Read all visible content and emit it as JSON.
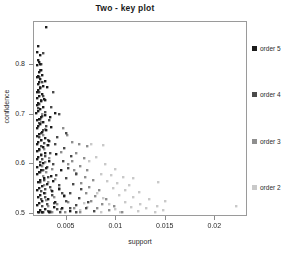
{
  "chart_data": {
    "type": "scatter",
    "title": "Two -  key plot",
    "xlabel": "support",
    "ylabel": "confidence",
    "xlim": [
      0.0018,
      0.0232
    ],
    "ylim": [
      0.495,
      0.885
    ],
    "grid": false,
    "legend_position": "right",
    "xticks": [
      0.005,
      0.01,
      0.015,
      0.02
    ],
    "xtick_labels": [
      "0.005",
      "0.01",
      "0.015",
      "0.02"
    ],
    "yticks": [
      0.5,
      0.6,
      0.7,
      0.8
    ],
    "ytick_labels": [
      "0.5",
      "0.6",
      "0.7",
      "0.8"
    ],
    "series": [
      {
        "name": "order 5",
        "color": "#1c1c1c",
        "points": [
          [
            0.00302,
            0.8755
          ],
          [
            0.00222,
            0.836
          ],
          [
            0.00212,
            0.824
          ],
          [
            0.00236,
            0.819
          ],
          [
            0.00218,
            0.8085
          ],
          [
            0.00226,
            0.805
          ],
          [
            0.0024,
            0.801
          ],
          [
            0.00214,
            0.7985
          ],
          [
            0.0025,
            0.789
          ],
          [
            0.00232,
            0.783
          ],
          [
            0.00262,
            0.7775
          ],
          [
            0.00222,
            0.776
          ],
          [
            0.0021,
            0.773
          ],
          [
            0.00244,
            0.769
          ],
          [
            0.0023,
            0.7645
          ],
          [
            0.00216,
            0.76
          ],
          [
            0.00268,
            0.7565
          ],
          [
            0.0024,
            0.752
          ],
          [
            0.0022,
            0.748
          ],
          [
            0.00208,
            0.744
          ],
          [
            0.00256,
            0.74
          ],
          [
            0.00232,
            0.736
          ],
          [
            0.00214,
            0.732
          ],
          [
            0.00278,
            0.729
          ],
          [
            0.00246,
            0.725
          ],
          [
            0.00222,
            0.721
          ],
          [
            0.00206,
            0.717
          ],
          [
            0.00268,
            0.713
          ],
          [
            0.00238,
            0.709
          ],
          [
            0.00218,
            0.705
          ],
          [
            0.00205,
            0.701
          ],
          [
            0.0029,
            0.698
          ],
          [
            0.00252,
            0.694
          ],
          [
            0.00228,
            0.69
          ],
          [
            0.0021,
            0.686
          ],
          [
            0.00272,
            0.682
          ],
          [
            0.0024,
            0.678
          ],
          [
            0.0022,
            0.674
          ],
          [
            0.00206,
            0.67
          ],
          [
            0.003,
            0.667
          ],
          [
            0.00258,
            0.663
          ],
          [
            0.0023,
            0.659
          ],
          [
            0.00212,
            0.655
          ],
          [
            0.00286,
            0.651
          ],
          [
            0.00246,
            0.647
          ],
          [
            0.00222,
            0.643
          ],
          [
            0.00207,
            0.639
          ],
          [
            0.00318,
            0.636
          ],
          [
            0.00266,
            0.632
          ],
          [
            0.00234,
            0.628
          ],
          [
            0.00214,
            0.624
          ],
          [
            0.00296,
            0.62
          ],
          [
            0.0025,
            0.616
          ],
          [
            0.00224,
            0.612
          ],
          [
            0.00208,
            0.608
          ],
          [
            0.00336,
            0.605
          ],
          [
            0.00272,
            0.601
          ],
          [
            0.00236,
            0.597
          ],
          [
            0.00215,
            0.593
          ],
          [
            0.00306,
            0.589
          ],
          [
            0.00254,
            0.585
          ],
          [
            0.00226,
            0.581
          ],
          [
            0.00209,
            0.577
          ],
          [
            0.0035,
            0.574
          ],
          [
            0.00278,
            0.57
          ],
          [
            0.00238,
            0.566
          ],
          [
            0.00216,
            0.562
          ],
          [
            0.00314,
            0.558
          ],
          [
            0.00256,
            0.554
          ],
          [
            0.00228,
            0.55
          ],
          [
            0.0021,
            0.546
          ],
          [
            0.00366,
            0.543
          ],
          [
            0.00284,
            0.539
          ],
          [
            0.0024,
            0.535
          ],
          [
            0.00217,
            0.531
          ],
          [
            0.00322,
            0.527
          ],
          [
            0.00258,
            0.523
          ],
          [
            0.00229,
            0.519
          ],
          [
            0.00211,
            0.515
          ],
          [
            0.0038,
            0.512
          ],
          [
            0.0029,
            0.508
          ],
          [
            0.00242,
            0.505
          ],
          [
            0.00218,
            0.502
          ],
          [
            0.0033,
            0.5005
          ],
          [
            0.00262,
            0.5002
          ],
          [
            0.00232,
            0.5001
          ],
          [
            0.0039,
            0.7005
          ],
          [
            0.00356,
            0.672
          ],
          [
            0.00336,
            0.6455
          ],
          [
            0.00404,
            0.6185
          ],
          [
            0.00448,
            0.586
          ],
          [
            0.00372,
            0.564
          ],
          [
            0.00428,
            0.5475
          ],
          [
            0.00486,
            0.533
          ],
          [
            0.00396,
            0.5205
          ],
          [
            0.0046,
            0.51
          ],
          [
            0.0054,
            0.5035
          ],
          [
            0.0031,
            0.753
          ],
          [
            0.00296,
            0.728
          ],
          [
            0.0034,
            0.6935
          ],
          [
            0.00288,
            0.766
          ]
        ]
      },
      {
        "name": "order 4",
        "color": "#4a4a4a",
        "points": [
          [
            0.00268,
            0.8215
          ],
          [
            0.00248,
            0.8005
          ],
          [
            0.00238,
            0.788
          ],
          [
            0.00228,
            0.773
          ],
          [
            0.00258,
            0.764
          ],
          [
            0.0024,
            0.753
          ],
          [
            0.00226,
            0.744
          ],
          [
            0.00274,
            0.7355
          ],
          [
            0.00252,
            0.727
          ],
          [
            0.00234,
            0.719
          ],
          [
            0.00222,
            0.711
          ],
          [
            0.00288,
            0.7035
          ],
          [
            0.0026,
            0.696
          ],
          [
            0.0024,
            0.6885
          ],
          [
            0.00226,
            0.681
          ],
          [
            0.00306,
            0.674
          ],
          [
            0.00272,
            0.667
          ],
          [
            0.00246,
            0.66
          ],
          [
            0.0023,
            0.653
          ],
          [
            0.00324,
            0.6465
          ],
          [
            0.00284,
            0.64
          ],
          [
            0.00252,
            0.6335
          ],
          [
            0.00232,
            0.627
          ],
          [
            0.00346,
            0.621
          ],
          [
            0.00296,
            0.615
          ],
          [
            0.0026,
            0.609
          ],
          [
            0.00236,
            0.603
          ],
          [
            0.0037,
            0.5975
          ],
          [
            0.0031,
            0.592
          ],
          [
            0.00268,
            0.5865
          ],
          [
            0.0024,
            0.581
          ],
          [
            0.00398,
            0.576
          ],
          [
            0.00326,
            0.571
          ],
          [
            0.00276,
            0.566
          ],
          [
            0.00244,
            0.561
          ],
          [
            0.00428,
            0.5565
          ],
          [
            0.00344,
            0.552
          ],
          [
            0.00286,
            0.5475
          ],
          [
            0.00248,
            0.543
          ],
          [
            0.00462,
            0.539
          ],
          [
            0.00364,
            0.535
          ],
          [
            0.00296,
            0.531
          ],
          [
            0.00252,
            0.527
          ],
          [
            0.005,
            0.5235
          ],
          [
            0.00386,
            0.52
          ],
          [
            0.00308,
            0.5165
          ],
          [
            0.00256,
            0.513
          ],
          [
            0.00544,
            0.51
          ],
          [
            0.00412,
            0.507
          ],
          [
            0.00322,
            0.504
          ],
          [
            0.00262,
            0.502
          ],
          [
            0.006,
            0.5008
          ],
          [
            0.00444,
            0.5005
          ],
          [
            0.0034,
            0.5003
          ],
          [
            0.0027,
            0.5001
          ],
          [
            0.00436,
            0.6985
          ],
          [
            0.00502,
            0.661
          ],
          [
            0.00412,
            0.6525
          ],
          [
            0.00478,
            0.631
          ],
          [
            0.00554,
            0.614
          ],
          [
            0.0047,
            0.604
          ],
          [
            0.0052,
            0.5895
          ],
          [
            0.00602,
            0.577
          ],
          [
            0.005,
            0.57
          ],
          [
            0.00572,
            0.558
          ],
          [
            0.00654,
            0.547
          ],
          [
            0.00548,
            0.54
          ],
          [
            0.00636,
            0.53
          ],
          [
            0.00722,
            0.5215
          ],
          [
            0.006,
            0.516
          ],
          [
            0.007,
            0.5085
          ],
          [
            0.0079,
            0.503
          ],
          [
            0.00376,
            0.744
          ],
          [
            0.0035,
            0.714
          ],
          [
            0.00332,
            0.687
          ],
          [
            0.0039,
            0.638
          ]
        ]
      },
      {
        "name": "order 3",
        "color": "#8e8e8e",
        "points": [
          [
            0.00262,
            0.7
          ],
          [
            0.00248,
            0.683
          ],
          [
            0.00288,
            0.669
          ],
          [
            0.00266,
            0.657
          ],
          [
            0.0025,
            0.646
          ],
          [
            0.00308,
            0.637
          ],
          [
            0.00276,
            0.628
          ],
          [
            0.00254,
            0.619
          ],
          [
            0.00334,
            0.611
          ],
          [
            0.0029,
            0.603
          ],
          [
            0.0026,
            0.595
          ],
          [
            0.00362,
            0.588
          ],
          [
            0.00306,
            0.581
          ],
          [
            0.00268,
            0.574
          ],
          [
            0.00396,
            0.568
          ],
          [
            0.00326,
            0.562
          ],
          [
            0.00278,
            0.556
          ],
          [
            0.00434,
            0.5505
          ],
          [
            0.0035,
            0.545
          ],
          [
            0.0029,
            0.54
          ],
          [
            0.00478,
            0.535
          ],
          [
            0.00378,
            0.5305
          ],
          [
            0.00304,
            0.526
          ],
          [
            0.00528,
            0.5215
          ],
          [
            0.0041,
            0.5175
          ],
          [
            0.0032,
            0.5135
          ],
          [
            0.00584,
            0.51
          ],
          [
            0.00448,
            0.507
          ],
          [
            0.0034,
            0.504
          ],
          [
            0.00648,
            0.5015
          ],
          [
            0.00492,
            0.5008
          ],
          [
            0.00366,
            0.5003
          ],
          [
            0.0056,
            0.642
          ],
          [
            0.00636,
            0.638
          ],
          [
            0.0072,
            0.634
          ],
          [
            0.006,
            0.62
          ],
          [
            0.0068,
            0.61
          ],
          [
            0.0056,
            0.604
          ],
          [
            0.0064,
            0.594
          ],
          [
            0.0072,
            0.586
          ],
          [
            0.006,
            0.58
          ],
          [
            0.0069,
            0.572
          ],
          [
            0.0078,
            0.565
          ],
          [
            0.0065,
            0.559
          ],
          [
            0.0074,
            0.551
          ],
          [
            0.0084,
            0.545
          ],
          [
            0.007,
            0.539
          ],
          [
            0.008,
            0.533
          ],
          [
            0.0091,
            0.528
          ],
          [
            0.0076,
            0.523
          ],
          [
            0.0087,
            0.518
          ],
          [
            0.0099,
            0.513
          ],
          [
            0.0082,
            0.509
          ],
          [
            0.0094,
            0.505
          ],
          [
            0.0107,
            0.502
          ],
          [
            0.0051,
            0.656
          ],
          [
            0.0047,
            0.67
          ],
          [
            0.00524,
            0.598
          ],
          [
            0.00586,
            0.586
          ],
          [
            0.00452,
            0.623
          ]
        ]
      },
      {
        "name": "order 2",
        "color": "#c9c9c9",
        "points": [
          [
            0.0076,
            0.638
          ],
          [
            0.00872,
            0.636
          ],
          [
            0.00806,
            0.612
          ],
          [
            0.0074,
            0.605
          ],
          [
            0.009,
            0.598
          ],
          [
            0.01,
            0.588
          ],
          [
            0.0086,
            0.578
          ],
          [
            0.0096,
            0.576
          ],
          [
            0.0108,
            0.572
          ],
          [
            0.0118,
            0.57
          ],
          [
            0.0092,
            0.564
          ],
          [
            0.0102,
            0.56
          ],
          [
            0.0114,
            0.556
          ],
          [
            0.0143,
            0.562
          ],
          [
            0.0098,
            0.55
          ],
          [
            0.011,
            0.546
          ],
          [
            0.0124,
            0.542
          ],
          [
            0.0082,
            0.54
          ],
          [
            0.0104,
            0.536
          ],
          [
            0.0118,
            0.532
          ],
          [
            0.0134,
            0.528
          ],
          [
            0.015,
            0.524
          ],
          [
            0.0088,
            0.53
          ],
          [
            0.011,
            0.522
          ],
          [
            0.0125,
            0.518
          ],
          [
            0.0142,
            0.514
          ],
          [
            0.0094,
            0.518
          ],
          [
            0.0116,
            0.512
          ],
          [
            0.0131,
            0.509
          ],
          [
            0.0148,
            0.506
          ],
          [
            0.01,
            0.508
          ],
          [
            0.0123,
            0.504
          ],
          [
            0.014,
            0.502
          ],
          [
            0.02215,
            0.5135
          ],
          [
            0.0068,
            0.52
          ],
          [
            0.0072,
            0.512
          ],
          [
            0.0064,
            0.506
          ],
          [
            0.006,
            0.502
          ],
          [
            0.0105,
            0.501
          ],
          [
            0.0086,
            0.5005
          ]
        ]
      }
    ]
  },
  "axes": {
    "x_title": "support",
    "y_title": "confidence",
    "x_tick_labels": [
      "0.005",
      "0.01",
      "0.015",
      "0.02"
    ],
    "y_tick_labels": [
      "0.8",
      "0.7",
      "0.6",
      "0.5"
    ]
  },
  "legend": {
    "items": [
      {
        "label": "order 5",
        "color": "#1c1c1c"
      },
      {
        "label": "order 4",
        "color": "#4a4a4a"
      },
      {
        "label": "order 3",
        "color": "#8e8e8e"
      },
      {
        "label": "order 2",
        "color": "#c9c9c9"
      }
    ]
  }
}
